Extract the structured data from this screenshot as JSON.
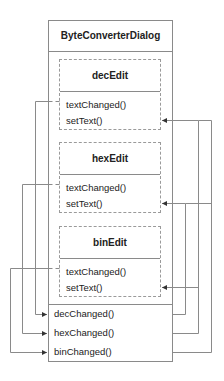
{
  "diagram": {
    "title": "ByteConverterDialog",
    "edits": [
      {
        "name": "decEdit",
        "signal": "textChanged()",
        "slot": "setText()"
      },
      {
        "name": "hexEdit",
        "signal": "textChanged()",
        "slot": "setText()"
      },
      {
        "name": "binEdit",
        "signal": "textChanged()",
        "slot": "setText()"
      }
    ],
    "dialog_slots": [
      "decChanged()",
      "hexChanged()",
      "binChanged()"
    ],
    "connections": [
      {
        "from": "decEdit.textChanged()",
        "to": "ByteConverterDialog.decChanged()"
      },
      {
        "from": "hexEdit.textChanged()",
        "to": "ByteConverterDialog.hexChanged()"
      },
      {
        "from": "binEdit.textChanged()",
        "to": "ByteConverterDialog.binChanged()"
      },
      {
        "from": "ByteConverterDialog.decChanged()",
        "to": "hexEdit.setText()"
      },
      {
        "from": "ByteConverterDialog.decChanged()",
        "to": "binEdit.setText()"
      },
      {
        "from": "ByteConverterDialog.hexChanged()",
        "to": "decEdit.setText()"
      },
      {
        "from": "ByteConverterDialog.hexChanged()",
        "to": "binEdit.setText()"
      },
      {
        "from": "ByteConverterDialog.binChanged()",
        "to": "decEdit.setText()"
      },
      {
        "from": "ByteConverterDialog.binChanged()",
        "to": "hexEdit.setText()"
      }
    ],
    "colors": {
      "line": "#8a8a8a",
      "text": "#222222",
      "background": "#ffffff"
    }
  }
}
